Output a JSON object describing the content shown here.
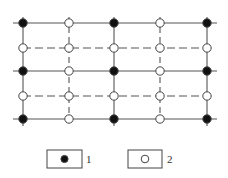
{
  "diagram": {
    "type": "grid-node-layout",
    "colors": {
      "line": "#555555",
      "filled_node": "#111111",
      "open_node": "#ffffff",
      "node_stroke": "#444444"
    },
    "columns_x": [
      23,
      69,
      114,
      160,
      207
    ],
    "rows_y": [
      23,
      48,
      71,
      96,
      119
    ],
    "solid_rows": [
      0,
      2,
      4
    ],
    "dashed_rows": [
      1,
      3
    ],
    "solid_columns": [
      0,
      2,
      4
    ],
    "dashed_columns": [
      1,
      3
    ],
    "nodes": [
      [
        "filled",
        "open",
        "filled",
        "open",
        "filled"
      ],
      [
        "open",
        "open",
        "open",
        "open",
        "open"
      ],
      [
        "filled",
        "open",
        "filled",
        "open",
        "filled"
      ],
      [
        "open",
        "open",
        "open",
        "open",
        "open"
      ],
      [
        "filled",
        "open",
        "filled",
        "open",
        "filled"
      ]
    ]
  },
  "legend": {
    "items": [
      {
        "symbol": "filled",
        "label": "1"
      },
      {
        "symbol": "open",
        "label": "2"
      }
    ]
  }
}
